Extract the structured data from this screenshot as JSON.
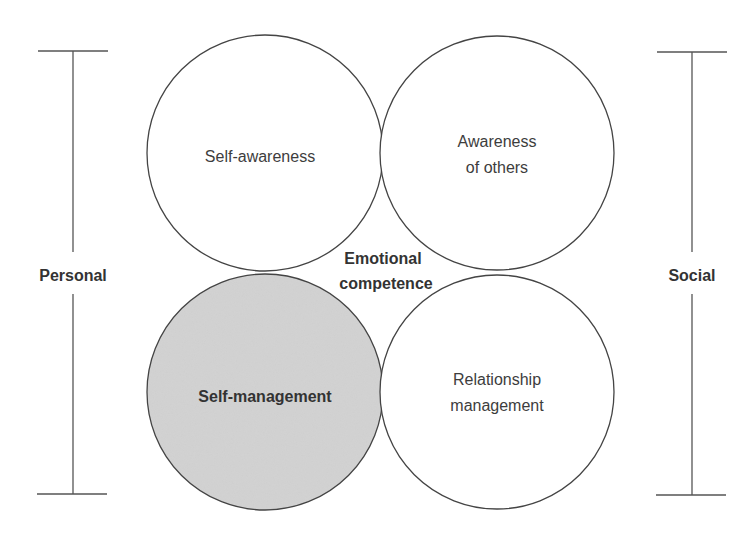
{
  "diagram": {
    "colors": {
      "stroke": "#444444",
      "circle_fill": "#ffffff",
      "highlight_fill": "#d3d3d3",
      "text": "#3d3d3d"
    },
    "center_label": {
      "line1": "Emotional",
      "line2": "competence"
    },
    "circles": [
      {
        "id": "self-awareness",
        "lines": [
          "Self-awareness"
        ],
        "highlighted": false,
        "bold": false
      },
      {
        "id": "awareness-of-others",
        "lines": [
          "Awareness",
          "of others"
        ],
        "highlighted": false,
        "bold": false
      },
      {
        "id": "self-management",
        "lines": [
          "Self-management"
        ],
        "highlighted": true,
        "bold": true
      },
      {
        "id": "relationship-management",
        "lines": [
          "Relationship",
          "management"
        ],
        "highlighted": false,
        "bold": false
      }
    ],
    "brackets": {
      "left": {
        "label": "Personal"
      },
      "right": {
        "label": "Social"
      }
    }
  }
}
